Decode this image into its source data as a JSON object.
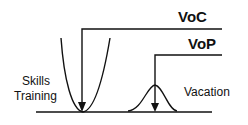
{
  "diagram": {
    "labels": {
      "voc": "VoC",
      "vop": "VoP",
      "left_line1": "Skills",
      "left_line2": "Training",
      "right": "Vacation"
    },
    "colors": {
      "stroke": "#111111",
      "background": "#ffffff"
    }
  }
}
